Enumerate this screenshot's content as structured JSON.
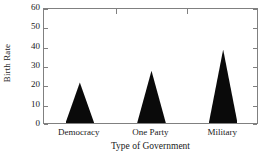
{
  "chart_data": {
    "type": "bar",
    "title": "",
    "subtitle": "",
    "categories": [
      "Democracy",
      "One Party",
      "Military"
    ],
    "values": [
      21,
      27,
      38
    ],
    "xlabel": "Type of Government",
    "ylabel": "Birth Rate",
    "ylim": [
      0,
      60
    ],
    "ytick_labels": [
      "0",
      "10",
      "20",
      "30",
      "40",
      "50",
      "60"
    ],
    "ytick_values": [
      0,
      10,
      20,
      30,
      40,
      50,
      60
    ],
    "grid": false,
    "legend": null,
    "legend_position": "none",
    "bar_shape": "triangle",
    "bar_color": "#0a0a0a",
    "frame_color": "#808080",
    "background": "#ffffff",
    "annotations": []
  }
}
